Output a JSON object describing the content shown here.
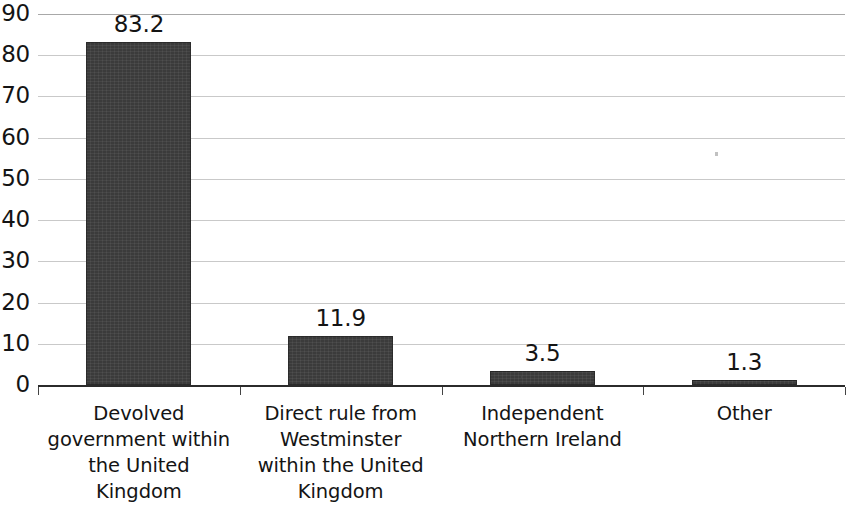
{
  "chart_data": {
    "type": "bar",
    "title": "",
    "subtitle": "",
    "xlabel": "",
    "ylabel": "",
    "categories": [
      "Devolved government within the United Kingdom",
      "Direct rule from Westminster within the United Kingdom",
      "Independent Northern Ireland",
      "Other"
    ],
    "category_lines": [
      [
        "Devolved",
        "government within",
        "the United",
        "Kingdom"
      ],
      [
        "Direct rule from",
        "Westminster",
        "within the United",
        "Kingdom"
      ],
      [
        "Independent",
        "Northern Ireland"
      ],
      [
        "Other"
      ]
    ],
    "values": [
      83.2,
      11.9,
      3.5,
      1.3
    ],
    "value_labels": [
      "83.2",
      "11.9",
      "3.5",
      "1.3"
    ],
    "ylim": [
      0,
      90
    ],
    "ytick_labels": [
      "90",
      "80",
      "70",
      "60",
      "50",
      "40",
      "30",
      "20",
      "10",
      "0"
    ],
    "ytick_values": [
      90,
      80,
      70,
      60,
      50,
      40,
      30,
      20,
      10,
      0
    ],
    "grid": true,
    "legend": null,
    "bar_color": "#3b3b3b",
    "gridline_color": "#c9c9c9",
    "axis_color": "#2b2b2b",
    "text_color": "#141414",
    "background_color": "#ffffff"
  }
}
